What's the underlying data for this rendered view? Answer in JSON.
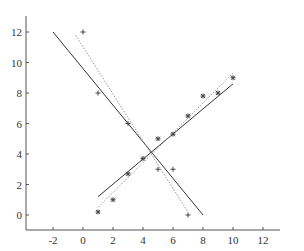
{
  "chart_data": {
    "type": "scatter",
    "title": "",
    "xlabel": "",
    "ylabel": "",
    "xlim": [
      -3.8,
      13.8
    ],
    "ylim": [
      -1,
      13
    ],
    "x_ticks": [
      -2,
      0,
      2,
      4,
      6,
      8,
      10,
      12
    ],
    "y_ticks": [
      0,
      2,
      4,
      6,
      8,
      10,
      12
    ],
    "grid": false,
    "legend": null,
    "series": [
      {
        "name": "descending points",
        "marker": "plus",
        "x": [
          0,
          1,
          3,
          5,
          6,
          7
        ],
        "y": [
          12,
          8,
          6,
          3,
          3,
          0
        ]
      },
      {
        "name": "ascending points",
        "marker": "star",
        "x": [
          1,
          2,
          3,
          4,
          5,
          6,
          7,
          8,
          9,
          10
        ],
        "y": [
          0.2,
          1,
          2.7,
          3.7,
          5,
          5.3,
          6.5,
          7.8,
          8,
          9
        ]
      }
    ],
    "lines": [
      {
        "name": "descending fit (solid)",
        "style": "solid",
        "color": "#333333",
        "x": [
          -2,
          8
        ],
        "y": [
          12,
          0
        ]
      },
      {
        "name": "descending fit (dotted)",
        "style": "dotted",
        "color": "#999999",
        "x": [
          -0.5,
          7
        ],
        "y": [
          11.8,
          0.2
        ]
      },
      {
        "name": "ascending fit (solid)",
        "style": "solid",
        "color": "#333333",
        "x": [
          1,
          10
        ],
        "y": [
          1.2,
          8.6
        ]
      },
      {
        "name": "ascending fit (dotted)",
        "style": "dotted",
        "color": "#999999",
        "x": [
          1,
          10
        ],
        "y": [
          0.5,
          9.3
        ]
      }
    ]
  }
}
